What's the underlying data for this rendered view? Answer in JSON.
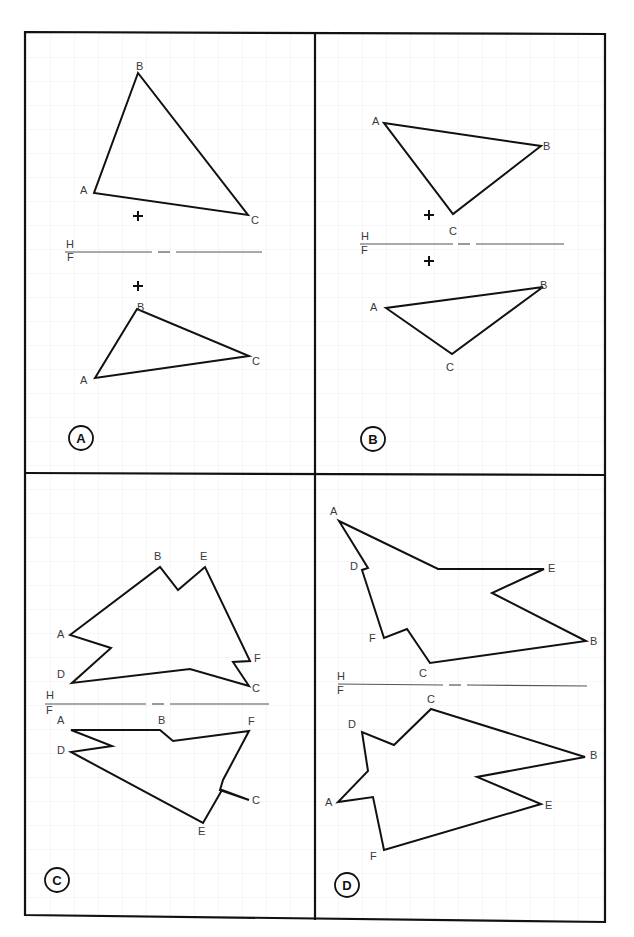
{
  "figure": {
    "title_fragment": "",
    "colors": {
      "line": "#111111",
      "grid": "#ececec",
      "label": "#3a3a3a",
      "paper": "#ffffff"
    },
    "panels": [
      {
        "id": "A",
        "circle_label": "A",
        "folding_line": {
          "upper": "H",
          "lower": "F"
        },
        "top_view": {
          "vertices": [
            "A",
            "B",
            "C"
          ]
        },
        "front_view": {
          "vertices": [
            "A",
            "B",
            "C"
          ]
        },
        "reference_marks": [
          "+",
          "+"
        ]
      },
      {
        "id": "B",
        "circle_label": "B",
        "folding_line": {
          "upper": "H",
          "lower": "F"
        },
        "top_view": {
          "vertices": [
            "A",
            "B",
            "C"
          ]
        },
        "front_view": {
          "vertices": [
            "A",
            "B",
            "C"
          ]
        },
        "reference_marks": [
          "+",
          "+"
        ]
      },
      {
        "id": "C",
        "circle_label": "C",
        "folding_line": {
          "upper": "H",
          "lower": "F"
        },
        "top_view": {
          "vertices": [
            "A",
            "B",
            "E",
            "F",
            "C",
            "D"
          ]
        },
        "front_view": {
          "vertices": [
            "A",
            "B",
            "F",
            "C",
            "E",
            "D"
          ]
        }
      },
      {
        "id": "D",
        "circle_label": "D",
        "folding_line": {
          "upper": "H",
          "lower": "F"
        },
        "top_view": {
          "vertices": [
            "A",
            "D",
            "F",
            "C",
            "B",
            "E"
          ]
        },
        "front_view": {
          "vertices": [
            "C",
            "D",
            "A",
            "F",
            "E",
            "B"
          ]
        }
      }
    ]
  },
  "labels": {
    "pA": {
      "B1": "B",
      "A1": "A",
      "C1": "C",
      "H": "H",
      "F": "F",
      "B2": "B",
      "A2": "A",
      "C2": "C",
      "circle": "A"
    },
    "pB": {
      "A1": "A",
      "B1": "B",
      "C1": "C",
      "H": "H",
      "F": "F",
      "B2": "B",
      "A2": "A",
      "C2": "C",
      "circle": "B"
    },
    "pC": {
      "B1": "B",
      "E1": "E",
      "A1": "A",
      "D1": "D",
      "F1": "F",
      "C1": "C",
      "H": "H",
      "F": "F",
      "A2": "A",
      "B2": "B",
      "F2": "F",
      "D2": "D",
      "C2": "C",
      "E2": "E",
      "circle": "C"
    },
    "pD": {
      "A1": "A",
      "D1": "D",
      "E1": "E",
      "F1": "F",
      "B1": "B",
      "C1": "C",
      "H": "H",
      "F": "F",
      "C2": "C",
      "D2": "D",
      "B2": "B",
      "A2": "A",
      "E2": "E",
      "F2": "F",
      "circle": "D"
    }
  }
}
